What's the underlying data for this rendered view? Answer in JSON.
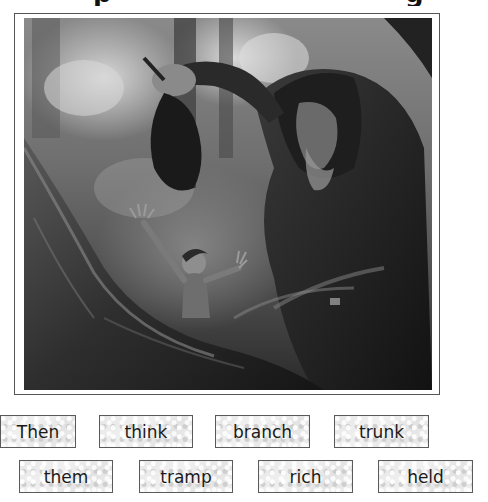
{
  "heading": {
    "visible_fragments": [
      {
        "text": "p",
        "x": 93
      },
      {
        "text": "g",
        "x": 405
      }
    ]
  },
  "illustration": {
    "description": "Grayscale painting: a hooded old man in a forest holds up a cloth bag while a frightened boy raises his hands beside a large tree trunk",
    "style": "grayscale"
  },
  "word_cards": {
    "row1": [
      {
        "word": "Then",
        "x": 0,
        "y": 415,
        "w": 76
      },
      {
        "word": "think",
        "x": 99,
        "y": 415,
        "w": 94
      },
      {
        "word": "branch",
        "x": 215,
        "y": 415,
        "w": 95
      },
      {
        "word": "trunk",
        "x": 334,
        "y": 415,
        "w": 95
      }
    ],
    "row2": [
      {
        "word": "them",
        "x": 19,
        "y": 460,
        "w": 94
      },
      {
        "word": "tramp",
        "x": 139,
        "y": 460,
        "w": 94
      },
      {
        "word": "rich",
        "x": 258,
        "y": 460,
        "w": 95
      },
      {
        "word": "held",
        "x": 378,
        "y": 460,
        "w": 95
      }
    ]
  },
  "colors": {
    "card_border": "#5a5a5a",
    "card_fill": "#e9e9e9",
    "text": "#1a1a1a",
    "frame_border": "#555555"
  }
}
